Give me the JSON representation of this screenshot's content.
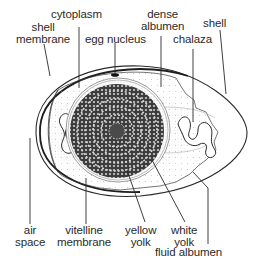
{
  "figure": {
    "colors": {
      "ink": "#2a2a2a",
      "yolk": "#3a3a3a",
      "background": "#ffffff"
    }
  },
  "labels": {
    "cytoplasm": {
      "lines": [
        "cytoplasm"
      ]
    },
    "shell_membrane": {
      "lines": [
        "shell",
        "membrane"
      ]
    },
    "egg_nucleus": {
      "lines": [
        "egg nucleus"
      ]
    },
    "dense_albumen": {
      "lines": [
        "dense",
        "albumen"
      ]
    },
    "shell": {
      "lines": [
        "shell"
      ]
    },
    "chalaza": {
      "lines": [
        "chalaza"
      ]
    },
    "air_space": {
      "lines": [
        "air",
        "space"
      ]
    },
    "vitelline_membrane": {
      "lines": [
        "vitelline",
        "membrane"
      ]
    },
    "yellow_yolk": {
      "lines": [
        "yellow",
        "yolk"
      ]
    },
    "white_yolk": {
      "lines": [
        "white",
        "yolk"
      ]
    },
    "fluid_albumen": {
      "lines": [
        "fluid albumen"
      ]
    }
  }
}
